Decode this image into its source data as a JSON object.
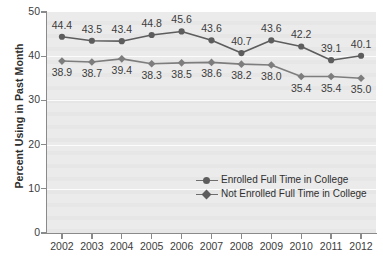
{
  "chart_data": {
    "type": "line",
    "title": "",
    "xlabel": "",
    "ylabel": "Percent Using in Past Month",
    "categories": [
      "2002",
      "2003",
      "2004",
      "2005",
      "2006",
      "2007",
      "2008",
      "2009",
      "2010",
      "2011",
      "2012"
    ],
    "ylim": [
      0,
      50
    ],
    "ytick_labels": [
      "0",
      "10",
      "20",
      "30",
      "40",
      "50"
    ],
    "yticks": [
      0,
      10,
      20,
      30,
      40,
      50
    ],
    "grid": true,
    "legend_position": "center-right",
    "series": [
      {
        "name": "Enrolled Full Time in College",
        "marker": "circle",
        "color": "#5d5d5d",
        "values": [
          44.4,
          43.5,
          43.4,
          44.8,
          45.6,
          43.6,
          40.7,
          43.6,
          42.2,
          39.1,
          40.1
        ],
        "labels": [
          "44.4",
          "43.5",
          "43.4",
          "44.8",
          "45.6",
          "43.6",
          "40.7",
          "43.6",
          "42.2",
          "39.1",
          "40.1"
        ],
        "label_positions": [
          "above",
          "above",
          "above",
          "above",
          "above",
          "above",
          "above",
          "above",
          "above",
          "above",
          "above"
        ]
      },
      {
        "name": "Not Enrolled Full Time in College",
        "marker": "diamond",
        "color": "#7d7d7d",
        "values": [
          38.9,
          38.7,
          39.4,
          38.3,
          38.5,
          38.6,
          38.2,
          38.0,
          35.4,
          35.4,
          35.0
        ],
        "labels": [
          "38.9",
          "38.7",
          "39.4",
          "38.3",
          "38.5",
          "38.6",
          "38.2",
          "38.0",
          "35.4",
          "35.4",
          "35.0"
        ],
        "label_positions": [
          "below",
          "below",
          "below",
          "below",
          "below",
          "below",
          "below",
          "below",
          "below",
          "below",
          "below"
        ]
      }
    ]
  },
  "legend": {
    "items": [
      {
        "label": "Enrolled Full Time in College",
        "marker": "circle"
      },
      {
        "label": "Not Enrolled Full Time in College",
        "marker": "diamond"
      }
    ]
  },
  "colors": {
    "series_1": "#5d5d5d",
    "series_2": "#7d7d7d",
    "plot_background": "#ebebeb",
    "axis": "#8a8a8a",
    "text": "#3c3c3c"
  }
}
